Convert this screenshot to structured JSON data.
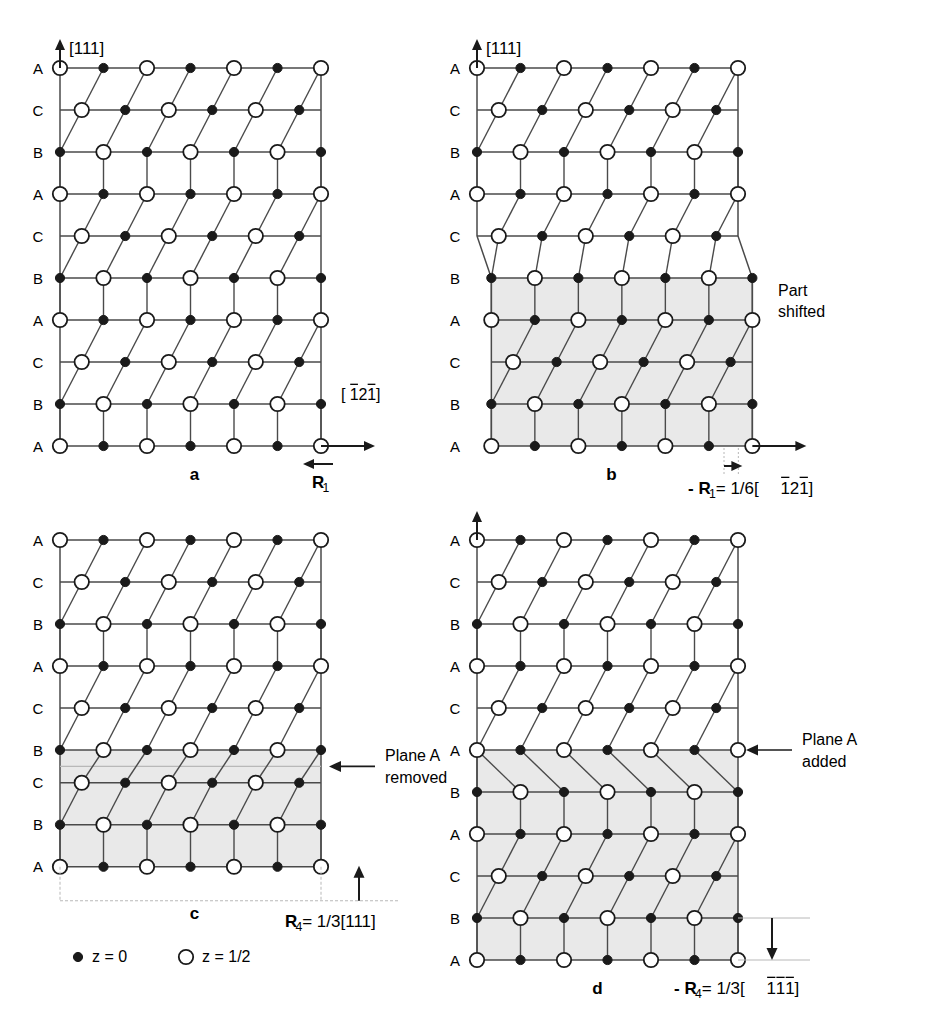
{
  "figure": {
    "lattice": {
      "open_circle_r": 7.2,
      "filled_circle_r": 4.6,
      "col_spacing": 43.5,
      "row_spacing": 42.0,
      "cols": 7,
      "shear_dx": 13.5
    },
    "panels": [
      {
        "id": "a",
        "label": "a",
        "x": 60,
        "y": 68,
        "rows": [
          "A",
          "C",
          "B",
          "A",
          "C",
          "B",
          "A",
          "C",
          "B",
          "A"
        ],
        "shaded_from": null,
        "axis_v_label": "[111]",
        "axis_h_label": "[̒1̒2̒1]",
        "axis_h_label_parts": [
          {
            "t": "[",
            "bar": false
          },
          {
            "t": "1",
            "bar": true
          },
          {
            "t": "2",
            "bar": false
          },
          {
            "t": "1",
            "bar": true
          },
          {
            "t": "]",
            "bar": false
          }
        ],
        "show_v_axis": true,
        "show_h_axis": true,
        "vector_label": "R",
        "vector_sub": "1",
        "vector_dir": "left"
      },
      {
        "id": "b",
        "label": "b",
        "x": 477,
        "y": 68,
        "rows": [
          "A",
          "C",
          "B",
          "A",
          "C",
          "B",
          "A",
          "C",
          "B",
          "A"
        ],
        "shaded_from": 5,
        "shift_cols": 0.33,
        "axis_v_label": "[111]",
        "show_v_axis": true,
        "show_h_axis": true,
        "note": "Part\nshifted",
        "note_line1": "Part",
        "note_line2": "shifted",
        "caption_parts": [
          {
            "t": "-",
            "bold": true
          },
          {
            "t": "R",
            "bold": true
          },
          {
            "t": "1",
            "sub": true
          },
          {
            "t": " = 1/6[",
            "bold": false
          },
          {
            "t": "1",
            "bar": true
          },
          {
            "t": "2",
            "bar": false
          },
          {
            "t": "1",
            "bar": true
          },
          {
            "t": "]",
            "bar": false
          }
        ]
      },
      {
        "id": "c",
        "label": "c",
        "x": 60,
        "y": 540,
        "rows": [
          "A",
          "C",
          "B",
          "A",
          "C",
          "B",
          "C",
          "B",
          "A"
        ],
        "removed_after": 5,
        "shaded_from": 5,
        "show_v_axis": false,
        "show_h_axis": false,
        "note_line1": "Plane A",
        "note_line2": "removed",
        "vector_dir": "up",
        "caption_parts": [
          {
            "t": "R",
            "bold": true
          },
          {
            "t": "4",
            "sub": true
          },
          {
            "t": " = 1/3[111]",
            "bold": false
          }
        ]
      },
      {
        "id": "d",
        "label": "d",
        "x": 477,
        "y": 540,
        "rows": [
          "A",
          "C",
          "B",
          "A",
          "C",
          "A",
          "B",
          "A",
          "C",
          "B",
          "A"
        ],
        "added_at": 5,
        "shaded_from": 5,
        "show_v_axis": true,
        "show_h_axis": false,
        "note_line1": "Plane A",
        "note_line2": "added",
        "vector_dir": "down",
        "caption_parts": [
          {
            "t": "-",
            "bold": true
          },
          {
            "t": "R",
            "bold": true
          },
          {
            "t": "4",
            "sub": true
          },
          {
            "t": " = 1/3[",
            "bold": false
          },
          {
            "t": "1",
            "bar": true
          },
          {
            "t": "1",
            "bar": true
          },
          {
            "t": "1",
            "bar": true
          },
          {
            "t": "]",
            "bar": false
          }
        ]
      }
    ],
    "legend": {
      "filled_label": "z = 0",
      "open_label": "z = 1/2"
    },
    "colors": {
      "shade": "#e9e9e9",
      "line": "#1a1a1a",
      "gridline": "#4a4a4a",
      "faint": "#b8b8b8",
      "text": "#000000"
    }
  }
}
